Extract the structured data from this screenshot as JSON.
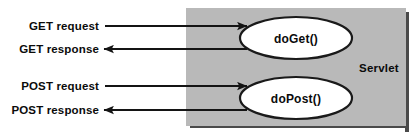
{
  "diagram": {
    "type": "servlet-request-flow",
    "canvas": {
      "width": 419,
      "height": 138,
      "background": "#ffffff"
    },
    "container": {
      "label": "Servlet",
      "fill": "#b9b9b9",
      "shadow_color": "#4a4a4a",
      "x": 186,
      "y": 8,
      "width": 222,
      "height": 120
    },
    "methods": [
      {
        "label": "doGet()",
        "shape": "ellipse",
        "fill": "#ffffff",
        "stroke": "#1a1a1a",
        "cx": 296,
        "cy": 38,
        "rx": 56,
        "ry": 21
      },
      {
        "label": "doPost()",
        "shape": "ellipse",
        "fill": "#ffffff",
        "stroke": "#1a1a1a",
        "cx": 296,
        "cy": 98,
        "rx": 56,
        "ry": 21
      }
    ],
    "flows": [
      {
        "label": "GET request",
        "direction": "inbound",
        "target": "doGet()",
        "y": 26,
        "line_from_x": 105,
        "line_to_x": 248,
        "label_anchor_x": 99,
        "label_baseline_y": 30,
        "color": "#141414"
      },
      {
        "label": "GET response",
        "direction": "outbound",
        "target": "doGet()",
        "y": 49,
        "line_from_x": 248,
        "line_to_x": 103,
        "label_anchor_x": 99,
        "label_baseline_y": 53,
        "color": "#141414"
      },
      {
        "label": "POST request",
        "direction": "inbound",
        "target": "doPost()",
        "y": 86,
        "line_from_x": 105,
        "line_to_x": 248,
        "label_anchor_x": 99,
        "label_baseline_y": 90,
        "color": "#141414"
      },
      {
        "label": "POST response",
        "direction": "outbound",
        "target": "doPost()",
        "y": 110,
        "line_from_x": 248,
        "line_to_x": 103,
        "label_anchor_x": 99,
        "label_baseline_y": 114,
        "color": "#141414"
      }
    ]
  }
}
